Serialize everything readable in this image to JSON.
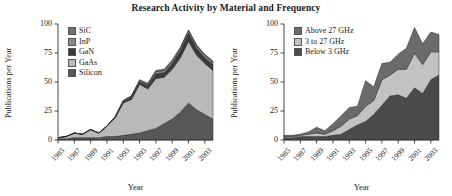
{
  "figure": {
    "title": "Research Activity by Material and Frequency"
  },
  "axes": {
    "ylabel": "Publications per Year",
    "xlabel": "Year",
    "yticks": [
      "0",
      "25",
      "50",
      "75",
      "100"
    ],
    "ytick_values": [
      0,
      25,
      50,
      75,
      100
    ],
    "ylim": [
      0,
      100
    ],
    "xticks": [
      "1985",
      "1987",
      "1989",
      "1991",
      "1993",
      "1995",
      "1997",
      "1999",
      "2001",
      "2003"
    ],
    "xtick_values": [
      1985,
      1987,
      1989,
      1991,
      1993,
      1995,
      1997,
      1999,
      2001,
      2003
    ],
    "xlim": [
      1985,
      2004
    ]
  },
  "colors": {
    "sic": "#6e6e6e",
    "inp": "#8a8a8a",
    "gan": "#3a3a3a",
    "gaas": "#b9b9b9",
    "silicon": "#575757",
    "above27": "#6b6b6b",
    "mid3to27": "#c2c2c2",
    "below3": "#4a4a4a",
    "axis": "#333333",
    "text": "#1a1a1a"
  },
  "chart_data": [
    {
      "type": "area",
      "stacked": true,
      "title": "Research Activity by Material",
      "xlabel": "Year",
      "ylabel": "Publications per Year",
      "ylim": [
        0,
        100
      ],
      "xlim": [
        1985,
        2004
      ],
      "grid": false,
      "legend_position": "upper-left",
      "x": [
        1985,
        1986,
        1987,
        1988,
        1989,
        1990,
        1991,
        1992,
        1993,
        1994,
        1995,
        1996,
        1997,
        1998,
        1999,
        2000,
        2001,
        2002,
        2003,
        2004
      ],
      "series": [
        {
          "name": "Silicon",
          "values": [
            1,
            1,
            2,
            2,
            2,
            2,
            3,
            3,
            4,
            5,
            6,
            8,
            10,
            14,
            18,
            24,
            32,
            26,
            22,
            18
          ]
        },
        {
          "name": "GaAs",
          "values": [
            1,
            2,
            4,
            3,
            7,
            4,
            9,
            16,
            28,
            30,
            42,
            36,
            43,
            40,
            43,
            47,
            53,
            47,
            44,
            42
          ]
        },
        {
          "name": "GaN",
          "values": [
            0,
            0,
            0,
            0,
            0,
            0,
            0,
            1,
            1,
            2,
            2,
            3,
            4,
            4,
            5,
            6,
            7,
            6,
            5,
            5
          ]
        },
        {
          "name": "InP",
          "values": [
            0,
            0,
            0,
            0,
            0,
            0,
            0,
            0,
            1,
            1,
            1,
            1,
            2,
            2,
            2,
            2,
            2,
            2,
            2,
            2
          ]
        },
        {
          "name": "SiC",
          "values": [
            0,
            0,
            0,
            0,
            0,
            0,
            0,
            0,
            0,
            0,
            1,
            1,
            1,
            1,
            1,
            1,
            1,
            1,
            1,
            1
          ]
        }
      ],
      "legend": [
        "SiC",
        "InP",
        "GaN",
        "GaAs",
        "Silicon"
      ]
    },
    {
      "type": "area",
      "stacked": true,
      "title": "Research Activity by Frequency",
      "xlabel": "Year",
      "ylabel": "Publications per Year",
      "ylim": [
        0,
        100
      ],
      "xlim": [
        1985,
        2004
      ],
      "grid": false,
      "legend_position": "upper-left",
      "x": [
        1985,
        1986,
        1987,
        1988,
        1989,
        1990,
        1991,
        1992,
        1993,
        1994,
        1995,
        1996,
        1997,
        1998,
        1999,
        2000,
        2001,
        2002,
        2003,
        2004
      ],
      "series": [
        {
          "name": "Below 3 GHz",
          "values": [
            2,
            2,
            3,
            3,
            3,
            3,
            4,
            5,
            9,
            13,
            16,
            22,
            30,
            38,
            39,
            36,
            45,
            40,
            52,
            56
          ]
        },
        {
          "name": "3 to 27 GHz",
          "values": [
            1,
            1,
            1,
            2,
            3,
            2,
            4,
            7,
            9,
            8,
            13,
            12,
            22,
            18,
            22,
            25,
            30,
            25,
            24,
            20
          ]
        },
        {
          "name": "Above 27 GHz",
          "values": [
            1,
            1,
            1,
            2,
            5,
            3,
            6,
            9,
            10,
            8,
            22,
            12,
            14,
            11,
            13,
            18,
            22,
            18,
            17,
            15
          ]
        }
      ],
      "legend": [
        "Above 27 GHz",
        "3 to 27 GHz",
        "Below 3 GHz"
      ]
    }
  ]
}
